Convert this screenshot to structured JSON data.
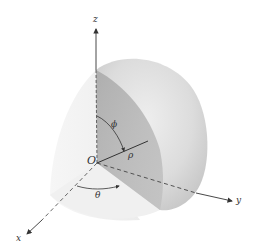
{
  "figure": {
    "axes": {
      "x": "x",
      "y": "y",
      "z": "z"
    },
    "origin_label": "O",
    "labels": {
      "phi": "ϕ",
      "rho": "ρ",
      "theta": "θ"
    },
    "colors": {
      "background": "#ffffff",
      "axis": "#333333",
      "cut_plane_dark": "#9a9a9a",
      "sphere_light": "#e6e6e6",
      "sphere_mid": "#cfcfcf",
      "left_surface": "#f1f1f1"
    }
  }
}
